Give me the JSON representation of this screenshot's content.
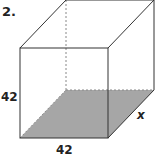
{
  "problem_number": "2.",
  "labels": {
    "height": "42",
    "width": "42",
    "depth": "x"
  },
  "colors": {
    "base_fill": "#a6a6a6",
    "edge": "#333333",
    "hidden_edge": "#888888"
  }
}
